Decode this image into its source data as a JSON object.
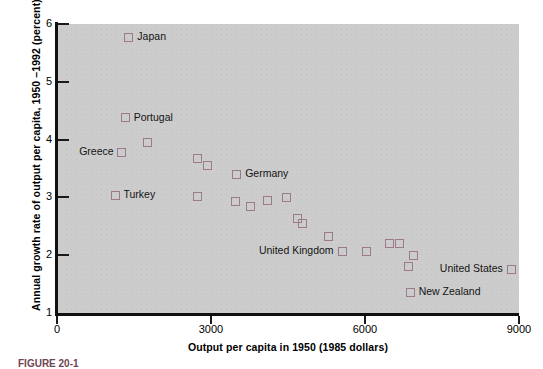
{
  "figure": {
    "caption": "FIGURE 20-1"
  },
  "chart_data": {
    "type": "scatter",
    "title": "",
    "xlabel": "Output per capita in 1950 (1985 dollars)",
    "ylabel": "Annual growth rate of output per capita, 1950 –1992 (percent)",
    "xlim": [
      0,
      9000
    ],
    "ylim": [
      1,
      6
    ],
    "xticks": [
      0,
      3000,
      6000,
      9000
    ],
    "yticks": [
      1,
      2,
      3,
      4,
      5,
      6
    ],
    "xtick_labels": [
      "0",
      "3000",
      "6000",
      "9000"
    ],
    "ytick_labels": [
      "1",
      "2",
      "3",
      "4",
      "5",
      "6"
    ],
    "grid": false,
    "legend": "none",
    "marker_color": "#9c7a8c",
    "plot_background": "#cccccc",
    "points": [
      {
        "label": "Japan",
        "label_side": "right",
        "x": 1400,
        "y": 5.77
      },
      {
        "label": "Portugal",
        "label_side": "right",
        "x": 1330,
        "y": 4.38
      },
      {
        "label": "",
        "label_side": "none",
        "x": 1760,
        "y": 3.95
      },
      {
        "label": "Greece",
        "label_side": "left",
        "x": 1260,
        "y": 3.78
      },
      {
        "label": "",
        "label_side": "none",
        "x": 2740,
        "y": 3.68
      },
      {
        "label": "",
        "label_side": "none",
        "x": 2930,
        "y": 3.56
      },
      {
        "label": "Germany",
        "label_side": "right",
        "x": 3500,
        "y": 3.4
      },
      {
        "label": "Turkey",
        "label_side": "right",
        "x": 1130,
        "y": 3.04
      },
      {
        "label": "",
        "label_side": "none",
        "x": 2740,
        "y": 3.02
      },
      {
        "label": "",
        "label_side": "none",
        "x": 3480,
        "y": 2.93
      },
      {
        "label": "",
        "label_side": "none",
        "x": 3760,
        "y": 2.84
      },
      {
        "label": "",
        "label_side": "none",
        "x": 4100,
        "y": 2.95
      },
      {
        "label": "",
        "label_side": "none",
        "x": 4480,
        "y": 3.0
      },
      {
        "label": "",
        "label_side": "none",
        "x": 4690,
        "y": 2.63
      },
      {
        "label": "",
        "label_side": "none",
        "x": 4790,
        "y": 2.55
      },
      {
        "label": "",
        "label_side": "none",
        "x": 5280,
        "y": 2.33
      },
      {
        "label": "United Kingdom",
        "label_side": "left",
        "x": 5560,
        "y": 2.07
      },
      {
        "label": "",
        "label_side": "none",
        "x": 6030,
        "y": 2.07
      },
      {
        "label": "",
        "label_side": "none",
        "x": 6480,
        "y": 2.21
      },
      {
        "label": "",
        "label_side": "none",
        "x": 6680,
        "y": 2.21
      },
      {
        "label": "",
        "label_side": "none",
        "x": 6950,
        "y": 1.99
      },
      {
        "label": "",
        "label_side": "none",
        "x": 6840,
        "y": 1.81
      },
      {
        "label": "United States",
        "label_side": "left",
        "x": 8850,
        "y": 1.76
      },
      {
        "label": "New Zealand",
        "label_side": "right",
        "x": 6880,
        "y": 1.36
      }
    ]
  }
}
